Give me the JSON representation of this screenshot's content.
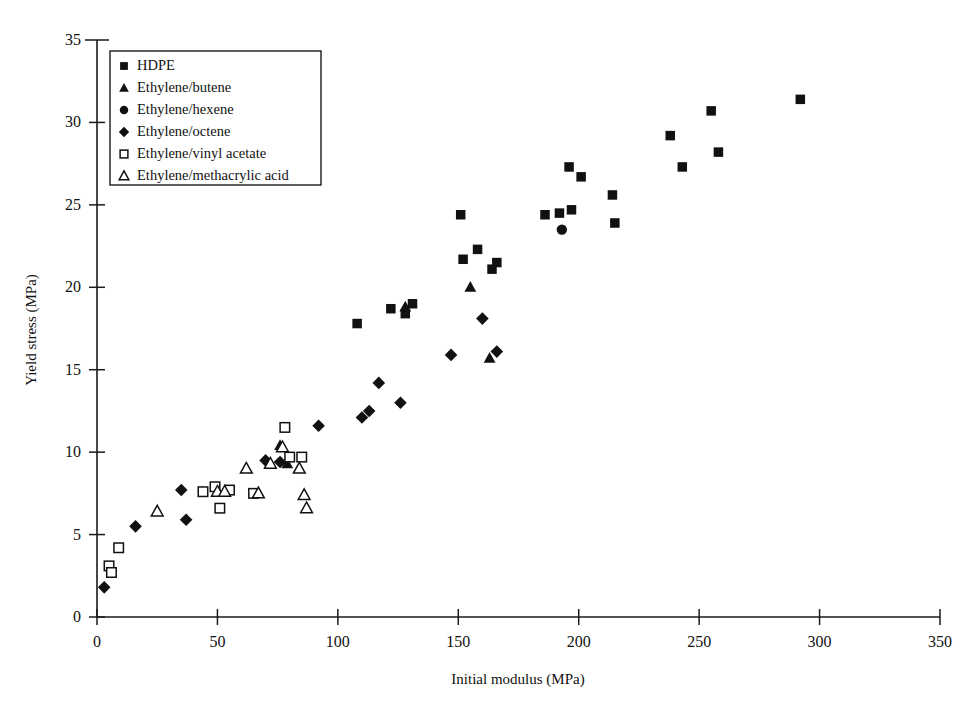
{
  "chart_data": {
    "type": "scatter",
    "title": "",
    "xlabel": "Initial modulus (MPa)",
    "ylabel": "Yield stress (MPa)",
    "xlim": [
      0,
      350
    ],
    "ylim": [
      0,
      35
    ],
    "xticks": [
      0,
      50,
      100,
      150,
      200,
      250,
      300,
      350
    ],
    "yticks": [
      0,
      5,
      10,
      15,
      20,
      25,
      30,
      35
    ],
    "grid": false,
    "legend_position": "upper-left",
    "series": [
      {
        "name": "HDPE",
        "marker": "filled-square",
        "points": [
          [
            108,
            17.8
          ],
          [
            122,
            18.7
          ],
          [
            128,
            18.4
          ],
          [
            131,
            19.0
          ],
          [
            151,
            24.4
          ],
          [
            152,
            21.7
          ],
          [
            158,
            22.3
          ],
          [
            164,
            21.1
          ],
          [
            166,
            21.5
          ],
          [
            186,
            24.4
          ],
          [
            192,
            24.5
          ],
          [
            196,
            27.3
          ],
          [
            197,
            24.7
          ],
          [
            201,
            26.7
          ],
          [
            214,
            25.6
          ],
          [
            215,
            23.9
          ],
          [
            238,
            29.2
          ],
          [
            243,
            27.3
          ],
          [
            255,
            30.7
          ],
          [
            258,
            28.2
          ],
          [
            292,
            31.4
          ]
        ]
      },
      {
        "name": "Ethylene/butene",
        "marker": "filled-triangle",
        "points": [
          [
            76,
            10.4
          ],
          [
            79,
            9.3
          ],
          [
            128,
            18.8
          ],
          [
            155,
            20.0
          ],
          [
            163,
            15.7
          ]
        ]
      },
      {
        "name": "Ethylene/hexene",
        "marker": "filled-circle",
        "points": [
          [
            193,
            23.5
          ]
        ]
      },
      {
        "name": "Ethylene/octene",
        "marker": "filled-diamond",
        "points": [
          [
            3,
            1.8
          ],
          [
            16,
            5.5
          ],
          [
            35,
            7.7
          ],
          [
            37,
            5.9
          ],
          [
            70,
            9.5
          ],
          [
            76,
            9.4
          ],
          [
            92,
            11.6
          ],
          [
            110,
            12.1
          ],
          [
            113,
            12.5
          ],
          [
            117,
            14.2
          ],
          [
            126,
            13.0
          ],
          [
            147,
            15.9
          ],
          [
            160,
            18.1
          ],
          [
            166,
            16.1
          ]
        ]
      },
      {
        "name": "Ethylene/vinyl acetate",
        "marker": "open-square",
        "points": [
          [
            5,
            3.1
          ],
          [
            6,
            2.7
          ],
          [
            9,
            4.2
          ],
          [
            44,
            7.6
          ],
          [
            49,
            7.9
          ],
          [
            51,
            6.6
          ],
          [
            55,
            7.7
          ],
          [
            65,
            7.5
          ],
          [
            78,
            11.5
          ],
          [
            80,
            9.7
          ],
          [
            85,
            9.7
          ]
        ]
      },
      {
        "name": "Ethylene/methacrylic acid",
        "marker": "open-triangle",
        "points": [
          [
            25,
            6.4
          ],
          [
            50,
            7.6
          ],
          [
            53,
            7.6
          ],
          [
            62,
            9.0
          ],
          [
            67,
            7.5
          ],
          [
            72,
            9.3
          ],
          [
            77,
            10.3
          ],
          [
            84,
            9.0
          ],
          [
            86,
            7.4
          ],
          [
            87,
            6.6
          ]
        ]
      }
    ]
  },
  "legend": {
    "entries": [
      {
        "label": "HDPE",
        "marker": "filled-square"
      },
      {
        "label": "Ethylene/butene",
        "marker": "filled-triangle"
      },
      {
        "label": "Ethylene/hexene",
        "marker": "filled-circle"
      },
      {
        "label": "Ethylene/octene",
        "marker": "filled-diamond"
      },
      {
        "label": "Ethylene/vinyl acetate",
        "marker": "open-square"
      },
      {
        "label": "Ethylene/methacrylic acid",
        "marker": "open-triangle"
      }
    ]
  }
}
